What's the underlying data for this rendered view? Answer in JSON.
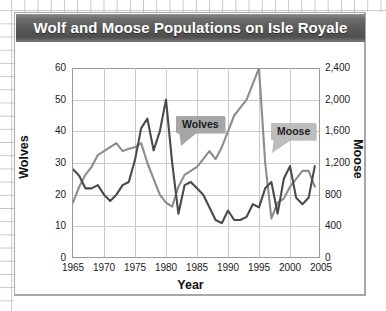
{
  "card": {
    "title": "Wolf and Moose Populations on Isle Royale"
  },
  "callouts": {
    "wolves": "Wolves",
    "moose": "Moose"
  },
  "axes": {
    "left_title": "Wolves",
    "right_title": "Moose",
    "x_title": "Year",
    "left_ticks": [
      "0",
      "10",
      "20",
      "30",
      "40",
      "50",
      "60"
    ],
    "right_ticks": [
      "0",
      "400",
      "800",
      "1,200",
      "1,600",
      "2,000",
      "2,400"
    ],
    "x_ticks": [
      "1965",
      "1970",
      "1975",
      "1980",
      "1985",
      "1990",
      "1995",
      "2000",
      "2005"
    ]
  },
  "colors": {
    "wolves_line": "#4a4a4a",
    "moose_line": "#8c8c8c",
    "title_bar": "#5a5a5a",
    "grid": "#c9c9c9",
    "axis": "#9a9a9a",
    "callout_wolves_bg": "#a6a6a6",
    "callout_moose_bg": "#bdbdbd"
  },
  "chart_data": {
    "type": "line",
    "title": "Wolf and Moose Populations on Isle Royale",
    "xlabel": "Year",
    "ylabel": "Wolves",
    "ylabel_secondary": "Moose",
    "xlim": [
      1965,
      2005
    ],
    "ylim": [
      0,
      60
    ],
    "ylim_secondary": [
      0,
      2400
    ],
    "grid": true,
    "legend_position": "callout-annotations",
    "x": [
      1965,
      1966,
      1967,
      1968,
      1969,
      1970,
      1971,
      1972,
      1973,
      1974,
      1975,
      1976,
      1977,
      1978,
      1979,
      1980,
      1981,
      1982,
      1983,
      1984,
      1985,
      1986,
      1987,
      1988,
      1989,
      1990,
      1991,
      1992,
      1993,
      1994,
      1995,
      1996,
      1997,
      1998,
      1999,
      2000,
      2001,
      2002,
      2003,
      2004
    ],
    "series": [
      {
        "name": "Wolves",
        "axis": "left",
        "color": "#4a4a4a",
        "units": "wolves",
        "values": [
          28,
          26,
          22,
          22,
          23,
          20,
          18,
          20,
          23,
          24,
          31,
          41,
          44,
          34,
          40,
          50,
          30,
          14,
          23,
          24,
          22,
          20,
          16,
          12,
          11,
          15,
          12,
          12,
          13,
          17,
          16,
          22,
          24,
          14,
          25,
          29,
          19,
          17,
          19,
          29
        ]
      },
      {
        "name": "Moose",
        "axis": "right",
        "color": "#8c8c8c",
        "units": "moose",
        "values": [
          700,
          900,
          1050,
          1150,
          1300,
          1350,
          1400,
          1450,
          1350,
          1380,
          1400,
          1450,
          1200,
          1000,
          800,
          700,
          650,
          900,
          1050,
          1100,
          1150,
          1250,
          1350,
          1250,
          1400,
          1600,
          1800,
          1900,
          2000,
          2200,
          2400,
          1200,
          500,
          700,
          750,
          900,
          1000,
          1100,
          1100,
          900
        ]
      }
    ]
  }
}
